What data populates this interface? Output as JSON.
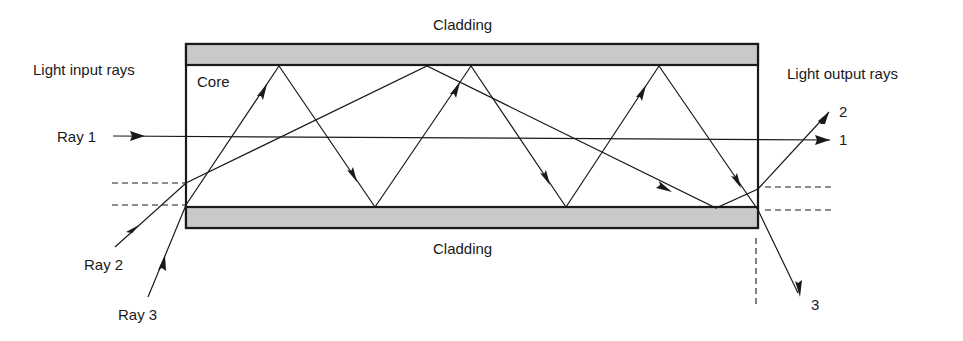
{
  "diagram": {
    "labels": {
      "cladding_top": "Cladding",
      "cladding_bottom": "Cladding",
      "core": "Core",
      "input_heading": "Light input rays",
      "output_heading": "Light output rays",
      "ray1_in": "Ray 1",
      "ray2_in": "Ray 2",
      "ray3_in": "Ray 3",
      "ray1_out": "1",
      "ray2_out": "2",
      "ray3_out": "3"
    },
    "colors": {
      "cladding_fill": "#c9c9c9",
      "stroke": "#1a1a1a",
      "core_fill": "#ffffff"
    },
    "rays": [
      {
        "name": "Ray 1",
        "description": "Axial ray, passes straight through core",
        "exit": "1"
      },
      {
        "name": "Ray 2",
        "description": "Low-angle ray, reflects at cladding boundary",
        "exit": "2"
      },
      {
        "name": "Ray 3",
        "description": "High-angle ray, multiple zig-zag reflections",
        "exit": "3"
      }
    ]
  }
}
